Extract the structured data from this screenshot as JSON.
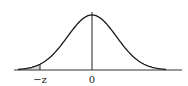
{
  "chart_data": {
    "type": "area",
    "title": "",
    "xlabel": "",
    "ylabel": "",
    "tick_labels": [
      "-z",
      "0"
    ],
    "annotations": [
      {
        "text": "-z",
        "x": -2.0,
        "kind": "vertical-marker"
      },
      {
        "text": "0",
        "x": 0,
        "kind": "center-line"
      }
    ],
    "distribution": "normal",
    "mean": 0,
    "sd": 1,
    "shaded_region": {
      "from": "-inf",
      "to": "-z"
    },
    "xlim": [
      -3,
      3
    ],
    "grid": false,
    "legend": null
  },
  "labels": {
    "neg_z": "−z",
    "zero": "0"
  },
  "colors": {
    "curve": "#1a1a1a",
    "axis": "#333333",
    "shade": "#d9d9d9"
  }
}
